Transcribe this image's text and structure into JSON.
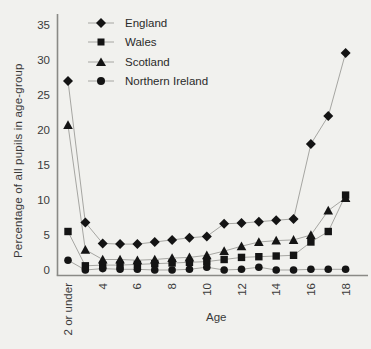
{
  "figure": {
    "background": "#f1f1ee",
    "line_color": "#a6a6a2",
    "marker_color": "#141414",
    "axis_color": "#8a8a86",
    "text_color": "#3a3a3a"
  },
  "chart_data": {
    "type": "line",
    "title": "",
    "xlabel": "Age",
    "ylabel": "Percentage of all pupils in age-group",
    "ylim": [
      0,
      35
    ],
    "yticks": [
      0,
      5,
      10,
      15,
      20,
      25,
      30,
      35
    ],
    "categories": [
      "2 or under",
      "3",
      "4",
      "5",
      "6",
      "7",
      "8",
      "9",
      "10",
      "11",
      "12",
      "13",
      "14",
      "15",
      "16",
      "17",
      "18"
    ],
    "xtick_shown_indices": [
      0,
      2,
      4,
      6,
      8,
      10,
      12,
      14,
      16
    ],
    "grid": false,
    "legend_position": "top-left-inside",
    "series": [
      {
        "name": "England",
        "marker": "diamond",
        "values": [
          27.0,
          6.8,
          3.8,
          3.7,
          3.7,
          4.0,
          4.3,
          4.6,
          4.8,
          6.6,
          6.7,
          6.9,
          7.1,
          7.3,
          18.0,
          22.0,
          31.0
        ]
      },
      {
        "name": "Wales",
        "marker": "square",
        "values": [
          5.5,
          0.6,
          0.7,
          0.7,
          0.8,
          0.9,
          1.0,
          1.1,
          1.2,
          1.5,
          1.8,
          1.9,
          2.0,
          2.1,
          4.0,
          5.5,
          10.7
        ]
      },
      {
        "name": "Scotland",
        "marker": "triangle",
        "values": [
          20.7,
          2.9,
          1.5,
          1.5,
          1.4,
          1.5,
          1.7,
          1.8,
          2.1,
          2.7,
          3.4,
          4.0,
          4.2,
          4.3,
          5.0,
          8.5,
          10.3
        ]
      },
      {
        "name": "Northern Ireland",
        "marker": "circle",
        "values": [
          1.4,
          0.0,
          0.2,
          0.1,
          0.1,
          0.0,
          0.0,
          0.1,
          0.4,
          0.0,
          0.1,
          0.4,
          0.0,
          0.0,
          0.1,
          0.1,
          0.1
        ]
      }
    ]
  }
}
